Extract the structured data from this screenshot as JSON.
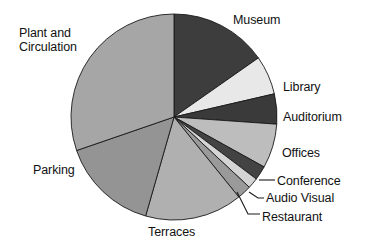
{
  "chart_data": {
    "type": "pie",
    "title": "",
    "subtitle": "",
    "xlabel": "",
    "ylabel": "",
    "legend_position": "none",
    "labels_position": "outside-callout",
    "grid": false,
    "total_degrees": 360,
    "start_angle_deg": 0,
    "direction": "clockwise",
    "categories": [
      "Museum",
      "Library",
      "Auditorium",
      "Offices",
      "Conference",
      "Audio Visual",
      "Restaurant",
      "Terraces",
      "Parking",
      "Plant and Circulation"
    ],
    "values": [
      15.3,
      6.1,
      4.7,
      6.9,
      2.2,
      1.7,
      2.2,
      15.3,
      15.3,
      30.3
    ],
    "units": "percent",
    "slices": [
      {
        "label": "Museum",
        "value": 15.3,
        "angle_deg": 55,
        "color": "#3d3d3d"
      },
      {
        "label": "Library",
        "value": 6.1,
        "angle_deg": 22,
        "color": "#e8e8e8"
      },
      {
        "label": "Auditorium",
        "value": 4.7,
        "angle_deg": 17,
        "color": "#3a3a3a"
      },
      {
        "label": "Offices",
        "value": 6.9,
        "angle_deg": 25,
        "color": "#bdbdbd"
      },
      {
        "label": "Conference",
        "value": 2.2,
        "angle_deg": 8,
        "color": "#434343"
      },
      {
        "label": "Audio Visual",
        "value": 1.7,
        "angle_deg": 6,
        "color": "#d4d4d4"
      },
      {
        "label": "Restaurant",
        "value": 2.2,
        "angle_deg": 8,
        "color": "#9a9a9a"
      },
      {
        "label": "Terraces",
        "value": 15.3,
        "angle_deg": 55,
        "color": "#b0b0b0"
      },
      {
        "label": "Parking",
        "value": 15.3,
        "angle_deg": 55,
        "color": "#949494"
      },
      {
        "label": "Plant and Circulation",
        "value": 30.3,
        "angle_deg": 109,
        "color": "#a6a6a6"
      }
    ]
  },
  "labels": {
    "museum": "Museum",
    "library": "Library",
    "auditorium": "Auditorium",
    "offices": "Offices",
    "conference": "Conference",
    "audio_visual": "Audio Visual",
    "restaurant": "Restaurant",
    "terraces": "Terraces",
    "parking": "Parking",
    "plant_line1": "Plant and",
    "plant_line2": "Circulation"
  },
  "geometry": {
    "center_x": 174,
    "center_y": 117,
    "radius": 103
  },
  "colors": {
    "background": "#ffffff",
    "text": "#111111",
    "outline": "#1a1a1a"
  }
}
